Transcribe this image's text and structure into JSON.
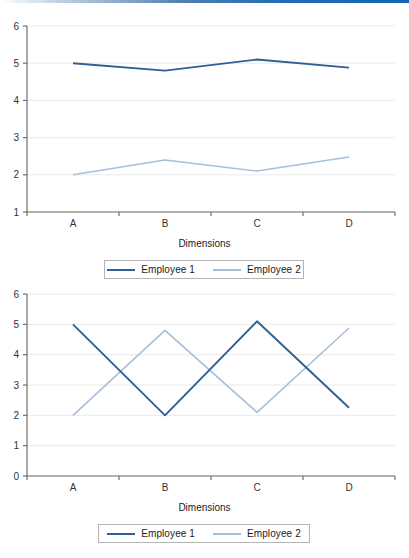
{
  "page": {
    "accent_color": "#1565b0",
    "background": "#ffffff"
  },
  "colors": {
    "series_1": "#2f5f93",
    "series_2": "#a6bfdd",
    "axis": "#6e6e6e",
    "gridline": "#e9e9e9",
    "tick_text": "#333333"
  },
  "chart_data": [
    {
      "id": "chart-top",
      "type": "line",
      "title": "",
      "xlabel": "Dimensions",
      "ylabel": "",
      "categories": [
        "A",
        "B",
        "C",
        "D"
      ],
      "ylim": [
        1,
        6
      ],
      "yticks": [
        1,
        2,
        3,
        4,
        5,
        6
      ],
      "ytick_labels": [
        "1",
        "2",
        "3",
        "4",
        "5",
        "6"
      ],
      "grid": true,
      "legend_position": "bottom",
      "series": [
        {
          "name": "Employee 1",
          "color": "#2f5f93",
          "values": [
            5.0,
            4.8,
            5.1,
            4.88
          ]
        },
        {
          "name": "Employee 2",
          "color": "#a6bfdd",
          "values": [
            2.0,
            2.4,
            2.1,
            2.48
          ]
        }
      ]
    },
    {
      "id": "chart-bottom",
      "type": "line",
      "title": "",
      "xlabel": "Dimensions",
      "ylabel": "",
      "categories": [
        "A",
        "B",
        "C",
        "D"
      ],
      "ylim": [
        0,
        6
      ],
      "yticks": [
        0,
        1,
        2,
        3,
        4,
        5,
        6
      ],
      "ytick_labels": [
        "0",
        "1",
        "2",
        "3",
        "4",
        "5",
        "6"
      ],
      "grid": true,
      "legend_position": "bottom",
      "series": [
        {
          "name": "Employee 1",
          "color": "#2f5f93",
          "values": [
            5.0,
            2.0,
            5.1,
            2.25
          ]
        },
        {
          "name": "Employee 2",
          "color": "#a6bfdd",
          "values": [
            2.0,
            4.8,
            2.1,
            4.88
          ]
        }
      ]
    }
  ]
}
